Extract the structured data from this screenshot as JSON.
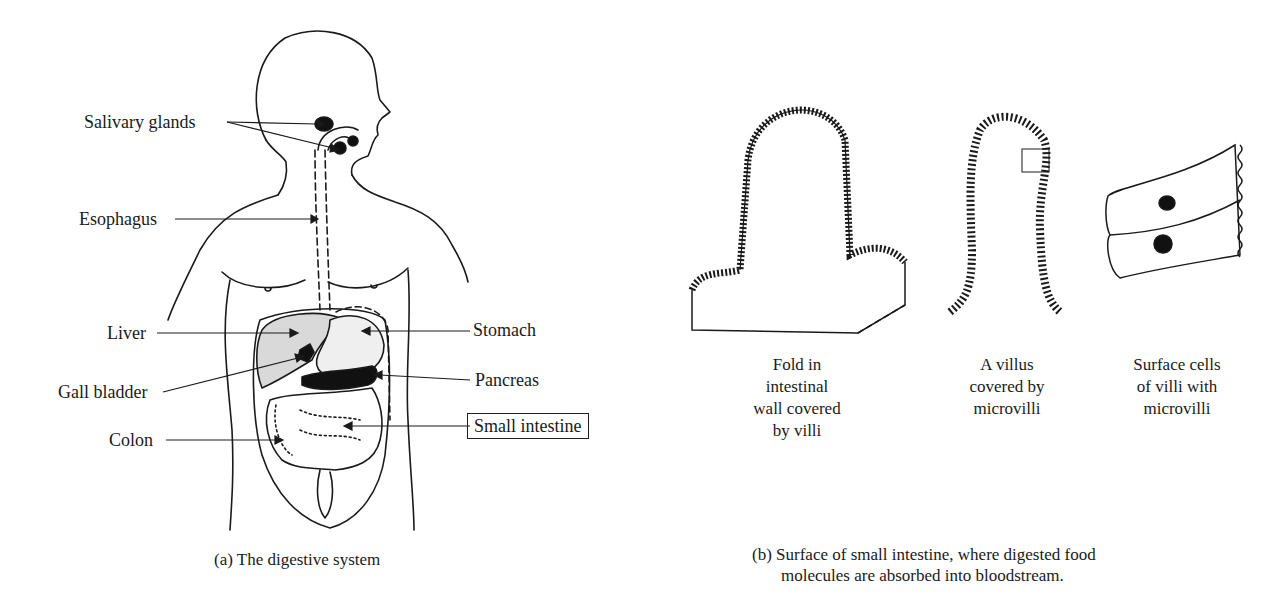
{
  "panel_a": {
    "caption": "(a)  The digestive system",
    "labels": {
      "salivary_glands": "Salivary glands",
      "esophagus": "Esophagus",
      "liver": "Liver",
      "gall_bladder": "Gall bladder",
      "colon": "Colon",
      "stomach": "Stomach",
      "pancreas": "Pancreas",
      "small_intestine": "Small intestine"
    },
    "highlighted_label": "small_intestine"
  },
  "panel_b": {
    "caption_line1": "(b)  Surface of small intestine, where digested food",
    "caption_line2": "molecules are absorbed into bloodstream.",
    "subfigures": [
      {
        "lines": [
          "Fold in",
          "intestinal",
          "wall covered",
          "by villi"
        ]
      },
      {
        "lines": [
          "A villus",
          "covered by",
          "microvilli"
        ]
      },
      {
        "lines": [
          "Surface cells",
          "of villi with",
          "microvilli"
        ]
      }
    ]
  }
}
